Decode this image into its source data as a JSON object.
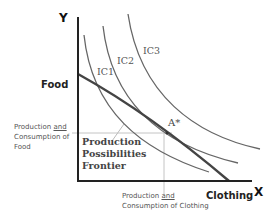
{
  "diagram": {
    "type": "economics-ppf-indifference",
    "axes": {
      "y_letter": "Y",
      "x_letter": "X",
      "y_name": "Food",
      "x_name": "Clothing"
    },
    "curves": {
      "ic1": "IC1",
      "ic2": "IC2",
      "ic3": "IC3",
      "ppf": "Production Possibilities Frontier"
    },
    "ppf_label_lines": [
      "Production",
      "Possibilities",
      "Frontier"
    ],
    "point_label": "A*",
    "food_annotation": {
      "prefix": "Production ",
      "underlined": "and",
      "suffix": " Consumption of Food"
    },
    "clothing_annotation": {
      "prefix": "Production ",
      "underlined": "and",
      "suffix": " Consumption of Clothing"
    },
    "colors": {
      "axis": "#222222",
      "ppf": "#444444",
      "indifference": "#666666",
      "guide": "#bbbbbb"
    }
  }
}
